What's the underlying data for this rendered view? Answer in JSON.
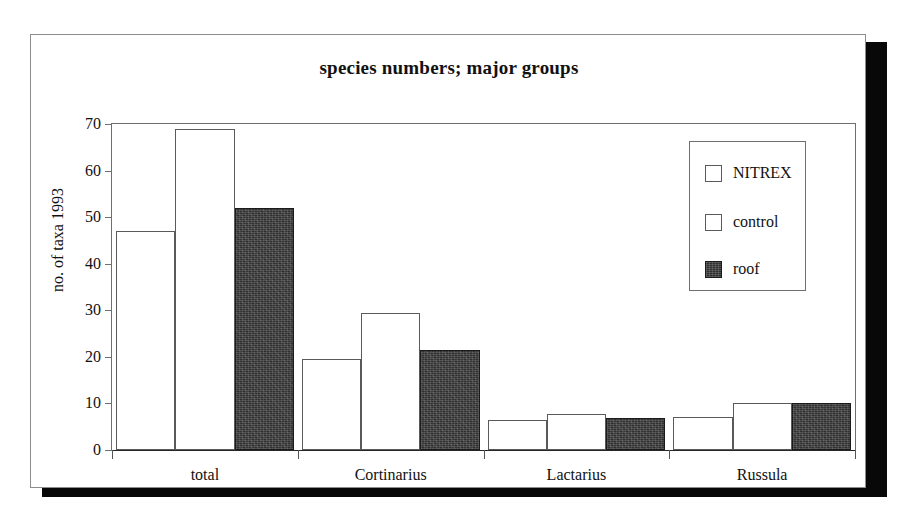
{
  "chart_data": {
    "type": "bar",
    "title": "species numbers; major groups",
    "xlabel": "",
    "ylabel": "no. of taxa 1993",
    "ylim": [
      0,
      70
    ],
    "yticks": [
      0,
      10,
      20,
      30,
      40,
      50,
      60,
      70
    ],
    "grid": false,
    "legend_position": "upper-right",
    "categories": [
      "total",
      "Cortinarius",
      "Lactarius",
      "Russula"
    ],
    "series": [
      {
        "name": "NITREX",
        "fill": "open",
        "values": [
          47,
          19.5,
          6.5,
          7
        ]
      },
      {
        "name": "control",
        "fill": "open",
        "values": [
          69,
          29.5,
          7.7,
          10
        ]
      },
      {
        "name": "roof",
        "fill": "filled",
        "values": [
          52,
          21.5,
          6.8,
          10
        ]
      }
    ]
  },
  "legend": {
    "entries": [
      {
        "label": "NITREX",
        "swatch": "open-square-icon"
      },
      {
        "label": "control",
        "swatch": "open-square-icon"
      },
      {
        "label": "roof",
        "swatch": "filled-square-icon"
      }
    ]
  },
  "colors": {
    "bar_open_fill": "#ffffff",
    "bar_open_stroke": "#5a5a5a",
    "bar_filled_fill": "#303030",
    "bar_filled_stroke": "#1b1b1b",
    "axis": "#6f6f6f",
    "text": "#111111",
    "shadow": "#080808",
    "card": "#ffffff"
  }
}
